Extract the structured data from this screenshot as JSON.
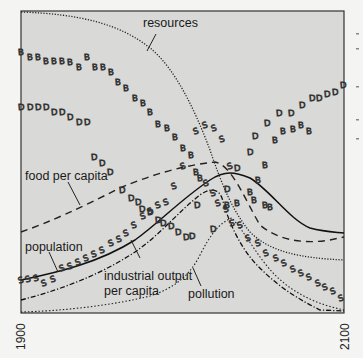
{
  "chart_data": {
    "type": "line",
    "title": "",
    "xlabel": "",
    "ylabel": "",
    "x_range": [
      1900,
      2100
    ],
    "x_tick_labels": [
      "1900",
      "2100"
    ],
    "grid": false,
    "legend": "inline labels with leader lines",
    "series": [
      {
        "name": "resources",
        "style": "dotted",
        "x": [
          1900,
          1940,
          1970,
          1990,
          2000,
          2010,
          2020,
          2030,
          2050,
          2070,
          2100
        ],
        "y": [
          1.0,
          0.98,
          0.9,
          0.78,
          0.68,
          0.55,
          0.42,
          0.3,
          0.24,
          0.21,
          0.2
        ]
      },
      {
        "name": "food per capita",
        "style": "dashed",
        "x": [
          1900,
          1930,
          1960,
          1980,
          2000,
          2015,
          2030,
          2050,
          2070,
          2100
        ],
        "y": [
          0.47,
          0.52,
          0.6,
          0.64,
          0.66,
          0.6,
          0.4,
          0.31,
          0.29,
          0.32
        ]
      },
      {
        "name": "population",
        "style": "solid",
        "x": [
          1900,
          1930,
          1960,
          1980,
          2000,
          2015,
          2030,
          2050,
          2070,
          2100
        ],
        "y": [
          0.2,
          0.24,
          0.32,
          0.43,
          0.55,
          0.58,
          0.53,
          0.42,
          0.35,
          0.33
        ]
      },
      {
        "name": "industrial output per capita",
        "style": "dash-dot",
        "x": [
          1900,
          1930,
          1960,
          1980,
          2000,
          2010,
          2020,
          2040,
          2070,
          2100
        ],
        "y": [
          0.11,
          0.17,
          0.28,
          0.41,
          0.52,
          0.5,
          0.3,
          0.12,
          0.04,
          0.03
        ]
      },
      {
        "name": "pollution",
        "style": "fine dotted",
        "x": [
          1900,
          1940,
          1970,
          1990,
          2000,
          2015,
          2030,
          2050,
          2070,
          2100
        ],
        "y": [
          0.0,
          0.01,
          0.04,
          0.1,
          0.22,
          0.4,
          0.32,
          0.18,
          0.08,
          0.03
        ]
      },
      {
        "name": "birth rate (B markers)",
        "style": "markers",
        "x": [
          1900,
          1920,
          1940,
          1960,
          1980,
          2000,
          2020,
          2040,
          2060,
          2080,
          2100
        ],
        "y": [
          0.88,
          0.85,
          0.83,
          0.78,
          0.68,
          0.58,
          0.4,
          0.5,
          0.62,
          0.72,
          0.76
        ]
      },
      {
        "name": "death rate (D markers)",
        "style": "markers",
        "x": [
          1900,
          1920,
          1940,
          1960,
          1980,
          2000,
          2020,
          2040,
          2060,
          2080,
          2100
        ],
        "y": [
          0.7,
          0.66,
          0.62,
          0.55,
          0.45,
          0.38,
          0.5,
          0.68,
          0.8,
          0.86,
          0.88
        ]
      },
      {
        "name": "services per capita (S markers)",
        "style": "markers",
        "x": [
          1900,
          1920,
          1940,
          1960,
          1980,
          2000,
          2020,
          2040,
          2060,
          2080,
          2100
        ],
        "y": [
          0.1,
          0.15,
          0.23,
          0.35,
          0.55,
          0.62,
          0.45,
          0.28,
          0.18,
          0.12,
          0.08
        ]
      }
    ],
    "annotations": [
      "resources",
      "food per capita",
      "population",
      "industrial output per capita",
      "pollution"
    ]
  },
  "labels": {
    "resources": "resources",
    "food": "food per capita",
    "population": "population",
    "industrial_1": "industrial output",
    "industrial_2": "per capita",
    "pollution": "pollution"
  },
  "axis": {
    "start_year": "1900",
    "end_year": "2100"
  },
  "markers": {
    "B": [
      [
        21,
        52
      ],
      [
        30,
        57
      ],
      [
        38,
        57
      ],
      [
        46,
        61
      ],
      [
        54,
        61
      ],
      [
        62,
        61
      ],
      [
        70,
        62
      ],
      [
        79,
        67
      ],
      [
        87,
        57
      ],
      [
        95,
        67
      ],
      [
        103,
        67
      ],
      [
        111,
        72
      ],
      [
        118,
        82
      ],
      [
        126,
        88
      ],
      [
        135,
        98
      ],
      [
        143,
        103
      ],
      [
        150,
        112
      ],
      [
        158,
        124
      ],
      [
        167,
        128
      ],
      [
        175,
        137
      ],
      [
        183,
        148
      ],
      [
        191,
        155
      ],
      [
        196,
        172
      ],
      [
        200,
        178
      ],
      [
        227,
        205
      ],
      [
        237,
        203
      ],
      [
        250,
        192
      ],
      [
        258,
        180
      ],
      [
        265,
        165
      ],
      [
        275,
        140
      ],
      [
        283,
        131
      ],
      [
        293,
        129
      ],
      [
        301,
        125
      ],
      [
        309,
        131
      ],
      [
        254,
        200
      ],
      [
        265,
        205
      ],
      [
        270,
        207
      ]
    ],
    "D": [
      [
        21,
        107
      ],
      [
        30,
        107
      ],
      [
        38,
        107
      ],
      [
        46,
        107
      ],
      [
        54,
        112
      ],
      [
        62,
        112
      ],
      [
        70,
        117
      ],
      [
        79,
        122
      ],
      [
        87,
        122
      ],
      [
        94,
        157
      ],
      [
        102,
        163
      ],
      [
        110,
        172
      ],
      [
        122,
        190
      ],
      [
        131,
        198
      ],
      [
        138,
        202
      ],
      [
        142,
        209
      ],
      [
        150,
        212
      ],
      [
        158,
        220
      ],
      [
        163,
        223
      ],
      [
        171,
        226
      ],
      [
        178,
        232
      ],
      [
        186,
        237
      ],
      [
        192,
        236
      ],
      [
        197,
        205
      ],
      [
        213,
        229
      ],
      [
        227,
        189
      ],
      [
        237,
        168
      ],
      [
        250,
        152
      ],
      [
        255,
        136
      ],
      [
        267,
        123
      ],
      [
        279,
        113
      ],
      [
        291,
        113
      ],
      [
        302,
        105
      ],
      [
        312,
        98
      ],
      [
        319,
        98
      ],
      [
        327,
        94
      ],
      [
        335,
        92
      ],
      [
        343,
        85
      ]
    ],
    "S": [
      [
        21,
        280
      ],
      [
        28,
        279
      ],
      [
        36,
        278
      ],
      [
        44,
        283
      ],
      [
        53,
        279
      ],
      [
        62,
        268
      ],
      [
        70,
        266
      ],
      [
        78,
        262
      ],
      [
        86,
        258
      ],
      [
        94,
        254
      ],
      [
        102,
        250
      ],
      [
        111,
        243
      ],
      [
        119,
        239
      ],
      [
        126,
        233
      ],
      [
        134,
        225
      ],
      [
        143,
        216
      ],
      [
        150,
        211
      ],
      [
        158,
        205
      ],
      [
        166,
        202
      ],
      [
        174,
        186
      ],
      [
        183,
        166
      ],
      [
        196,
        131
      ],
      [
        205,
        125
      ],
      [
        214,
        128
      ],
      [
        222,
        139
      ],
      [
        230,
        166
      ],
      [
        206,
        183
      ],
      [
        213,
        193
      ],
      [
        218,
        203
      ],
      [
        226,
        209
      ],
      [
        232,
        223
      ],
      [
        240,
        225
      ],
      [
        248,
        238
      ],
      [
        258,
        243
      ],
      [
        266,
        253
      ],
      [
        276,
        258
      ],
      [
        284,
        263
      ],
      [
        293,
        269
      ],
      [
        301,
        273
      ],
      [
        309,
        277
      ],
      [
        318,
        283
      ],
      [
        325,
        287
      ],
      [
        333,
        291
      ],
      [
        341,
        298
      ]
    ]
  }
}
